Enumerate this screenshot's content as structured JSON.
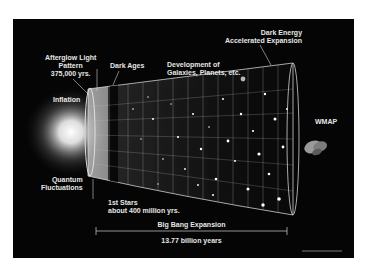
{
  "diagram": {
    "labels": {
      "afterglow": [
        "Afterglow Light",
        "Pattern",
        "375,000 yrs."
      ],
      "dark_ages": "Dark Ages",
      "development": [
        "Development of",
        "Galaxies, Planets, etc."
      ],
      "dark_energy": [
        "Dark Energy",
        "Accelerated Expansion"
      ],
      "inflation": "Inflation",
      "quantum": [
        "Quantum",
        "Fluctuations"
      ],
      "first_stars": [
        "1st Stars",
        "about 400 million yrs."
      ],
      "wmap": "WMAP",
      "big_bang": "Big Bang Expansion",
      "age": "13.77 billion years"
    },
    "colors": {
      "background": "#050505",
      "page": "#ffffff",
      "text": "#e6e6e6",
      "grid": "#bfbfbf",
      "glow": "#ffffff"
    }
  }
}
